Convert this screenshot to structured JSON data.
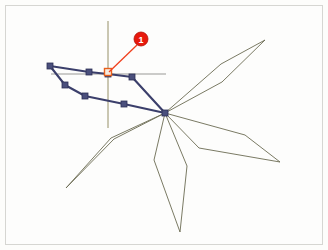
{
  "figure": {
    "background_color": "#fdfdfb",
    "frame_color": "#d6d6d2"
  },
  "chart_data": {
    "type": "line",
    "title": "",
    "subtitle": "",
    "xlabel": "",
    "ylabel": "",
    "grid": false,
    "legend_position": "none",
    "axis_ranges": {
      "x": [
        0,
        328
      ],
      "y": [
        0,
        250
      ]
    },
    "hub": {
      "x": 165,
      "y": 113,
      "label": "origin-hub"
    },
    "series": [
      {
        "name": "star-outline",
        "type": "polygon",
        "color": "#6b6b52",
        "stroke_width": 0.9,
        "marker": "none",
        "points": [
          [
            165,
            113
          ],
          [
            221,
            64
          ],
          [
            265,
            40
          ],
          [
            222,
            82
          ],
          [
            165,
            113
          ],
          [
            245,
            135
          ],
          [
            280,
            162
          ],
          [
            199,
            148
          ],
          [
            165,
            113
          ],
          [
            187,
            166
          ],
          [
            180,
            232
          ],
          [
            154,
            160
          ],
          [
            165,
            113
          ],
          [
            111,
            138
          ],
          [
            66,
            188
          ],
          [
            114,
            139
          ],
          [
            165,
            113
          ]
        ]
      },
      {
        "name": "measured-profile",
        "type": "polyline",
        "color": "#3b3f6b",
        "stroke_width": 2.1,
        "marker": "square",
        "marker_size": 6,
        "marker_color": "#4a4f7c",
        "marker_edge_color": "#2c2f55",
        "points": [
          [
            50,
            66
          ],
          [
            89,
            72
          ],
          [
            108,
            74
          ],
          [
            132,
            77
          ],
          [
            165,
            113
          ],
          [
            124,
            104
          ],
          [
            85,
            96
          ],
          [
            65,
            85
          ],
          [
            50,
            66
          ]
        ]
      }
    ],
    "axes_lines": [
      {
        "name": "vertical-axis",
        "color": "#8a8358",
        "stroke_width": 0.9,
        "x1": 108,
        "y1": 21,
        "x2": 108,
        "y2": 128
      },
      {
        "name": "horizontal-axis",
        "color": "#9a9a95",
        "stroke_width": 1.2,
        "x1": 51,
        "y1": 74,
        "x2": 166,
        "y2": 74
      }
    ],
    "annotations": [
      {
        "name": "callout-1",
        "label": "1",
        "badge_color": "#e8180c",
        "badge_edge_color": "#b01007",
        "text_color": "#ffffff",
        "badge_center": {
          "x": 141,
          "y": 39
        },
        "badge_radius": 7,
        "leader_color": "#f0401e",
        "leader_from": {
          "x": 137,
          "y": 45
        },
        "leader_to": {
          "x": 109,
          "y": 72
        },
        "target_marker": {
          "name": "highlighted-vertex",
          "x": 108,
          "y": 72,
          "size": 7,
          "fill": "#f5ece0",
          "edge_color": "#e8601c"
        }
      }
    ]
  }
}
